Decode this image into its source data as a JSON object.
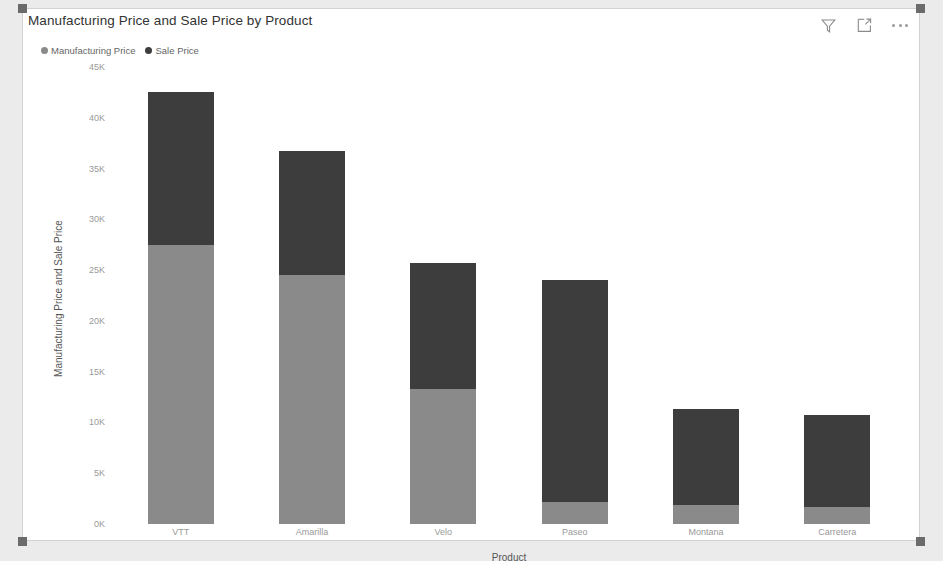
{
  "visual": {
    "title": "Manufacturing Price and Sale Price by Product",
    "actions": [
      {
        "name": "filter-icon",
        "label": "Filters"
      },
      {
        "name": "focus-mode-icon",
        "label": "Focus mode"
      },
      {
        "name": "more-options-icon",
        "label": "More options"
      }
    ]
  },
  "colors": {
    "manufacturing_price": "#8a8a8a",
    "sale_price": "#3d3d3d",
    "axis_text": "#999999",
    "title_text": "#333333",
    "plot_background": "#ffffff"
  },
  "chart_data": {
    "type": "bar",
    "subtype": "stacked-column",
    "title": "Manufacturing Price and Sale Price by Product",
    "xlabel": "Product",
    "ylabel": "Manufacturing Price and Sale Price",
    "categories": [
      "VTT",
      "Amarilla",
      "Velo",
      "Paseo",
      "Montana",
      "Carretera"
    ],
    "series": [
      {
        "name": "Manufacturing Price",
        "color": "#8a8a8a",
        "values": [
          27500,
          24500,
          13300,
          2200,
          1900,
          1700
        ]
      },
      {
        "name": "Sale Price",
        "color": "#3d3d3d",
        "values": [
          15000,
          12200,
          12400,
          21800,
          9400,
          9000
        ]
      }
    ],
    "totals": [
      42500,
      36700,
      25700,
      24000,
      11300,
      10700
    ],
    "ylim": [
      0,
      45000
    ],
    "yticks": [
      0,
      5000,
      10000,
      15000,
      20000,
      25000,
      30000,
      35000,
      40000,
      45000
    ],
    "ytick_labels": [
      "0K",
      "5K",
      "10K",
      "15K",
      "20K",
      "25K",
      "30K",
      "35K",
      "40K",
      "45K"
    ],
    "grid": false,
    "legend_position": "top-left",
    "legend": [
      "Manufacturing Price",
      "Sale Price"
    ]
  }
}
